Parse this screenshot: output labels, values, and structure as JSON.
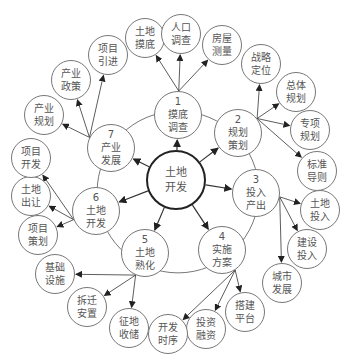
{
  "center": {
    "label1": "土地",
    "label2": "开发",
    "x": 176,
    "y": 180,
    "r": 30
  },
  "ring": [
    {
      "num": "1",
      "l1": "摸底",
      "l2": "调查",
      "x": 178,
      "y": 115,
      "r": 24
    },
    {
      "num": "2",
      "l1": "规划",
      "l2": "策划",
      "x": 238,
      "y": 133,
      "r": 24
    },
    {
      "num": "3",
      "l1": "投入",
      "l2": "产出",
      "x": 256,
      "y": 193,
      "r": 24
    },
    {
      "num": "4",
      "l1": "实施",
      "l2": "方案",
      "x": 222,
      "y": 250,
      "r": 24
    },
    {
      "num": "5",
      "l1": "土地",
      "l2": "熟化",
      "x": 145,
      "y": 253,
      "r": 24
    },
    {
      "num": "6",
      "l1": "土地",
      "l2": "开发",
      "x": 96,
      "y": 211,
      "r": 24
    },
    {
      "num": "7",
      "l1": "产业",
      "l2": "发展",
      "x": 111,
      "y": 148,
      "r": 24
    }
  ],
  "leaves": [
    {
      "l1": "土地",
      "l2": "摸底",
      "x": 145,
      "y": 38,
      "r": 20,
      "from": 0
    },
    {
      "l1": "人口",
      "l2": "调查",
      "x": 181,
      "y": 34,
      "r": 20,
      "from": 0
    },
    {
      "l1": "房屋",
      "l2": "测量",
      "x": 222,
      "y": 45,
      "r": 20,
      "from": 0
    },
    {
      "l1": "战略",
      "l2": "定位",
      "x": 261,
      "y": 64,
      "r": 20,
      "from": 1
    },
    {
      "l1": "总体",
      "l2": "规划",
      "x": 296,
      "y": 92,
      "r": 20,
      "from": 1
    },
    {
      "l1": "专项",
      "l2": "规划",
      "x": 310,
      "y": 130,
      "r": 20,
      "from": 1
    },
    {
      "l1": "标准",
      "l2": "导则",
      "x": 317,
      "y": 171,
      "r": 20,
      "from": 1
    },
    {
      "l1": "土地",
      "l2": "投入",
      "x": 320,
      "y": 210,
      "r": 20,
      "from": 2
    },
    {
      "l1": "建设",
      "l2": "投入",
      "x": 307,
      "y": 249,
      "r": 20,
      "from": 2
    },
    {
      "l1": "城市",
      "l2": "发展",
      "x": 282,
      "y": 283,
      "r": 20,
      "from": 2
    },
    {
      "l1": "搭建",
      "l2": "平台",
      "x": 245,
      "y": 312,
      "r": 20,
      "from": 3
    },
    {
      "l1": "投资",
      "l2": "融资",
      "x": 206,
      "y": 329,
      "r": 20,
      "from": 3
    },
    {
      "l1": "开发",
      "l2": "时序",
      "x": 168,
      "y": 334,
      "r": 20,
      "from": 3
    },
    {
      "l1": "征地",
      "l2": "收储",
      "x": 129,
      "y": 328,
      "r": 20,
      "from": 4
    },
    {
      "l1": "拆迁",
      "l2": "安置",
      "x": 87,
      "y": 307,
      "r": 20,
      "from": 4
    },
    {
      "l1": "基础",
      "l2": "设施",
      "x": 55,
      "y": 274,
      "r": 20,
      "from": 4
    },
    {
      "l1": "项目",
      "l2": "策划",
      "x": 38,
      "y": 235,
      "r": 20,
      "from": 5
    },
    {
      "l1": "土地",
      "l2": "出让",
      "x": 31,
      "y": 196,
      "r": 20,
      "from": 5
    },
    {
      "l1": "项目",
      "l2": "开发",
      "x": 31,
      "y": 158,
      "r": 20,
      "from": 5
    },
    {
      "l1": "产业",
      "l2": "规划",
      "x": 44,
      "y": 115,
      "r": 20,
      "from": 6
    },
    {
      "l1": "产业",
      "l2": "政策",
      "x": 71,
      "y": 80,
      "r": 20,
      "from": 6
    },
    {
      "l1": "项目",
      "l2": "引进",
      "x": 108,
      "y": 55,
      "r": 20,
      "from": 6
    }
  ],
  "colors": {
    "line": "#555555",
    "center_border": "#222222",
    "text": "#555555"
  }
}
